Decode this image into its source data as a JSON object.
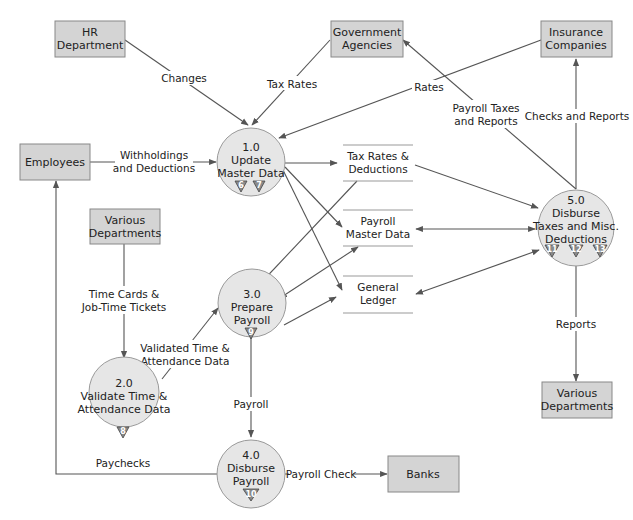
{
  "diagram": {
    "type": "data-flow-diagram",
    "entities": [
      {
        "id": "hr",
        "line1": "HR",
        "line2": "Department"
      },
      {
        "id": "gov",
        "line1": "Government",
        "line2": "Agencies"
      },
      {
        "id": "ins",
        "line1": "Insurance",
        "line2": "Companies"
      },
      {
        "id": "emp",
        "line1": "Employees",
        "line2": ""
      },
      {
        "id": "vd1",
        "line1": "Various",
        "line2": "Departments"
      },
      {
        "id": "vd2",
        "line1": "Various",
        "line2": "Departments"
      },
      {
        "id": "banks",
        "line1": "Banks",
        "line2": ""
      }
    ],
    "processes": [
      {
        "id": "p1",
        "number": "1.0",
        "line1": "Update",
        "line2": "Master Data",
        "line3": "",
        "markers": [
          "6",
          "7"
        ]
      },
      {
        "id": "p2",
        "number": "2.0",
        "line1": "Validate Time &",
        "line2": "Attendance Data",
        "line3": "",
        "markers": [
          "8"
        ]
      },
      {
        "id": "p3",
        "number": "3.0",
        "line1": "Prepare",
        "line2": "Payroll",
        "line3": "",
        "markers": [
          "9"
        ]
      },
      {
        "id": "p4",
        "number": "4.0",
        "line1": "Disburse",
        "line2": "Payroll",
        "line3": "",
        "markers": [
          "10"
        ]
      },
      {
        "id": "p5",
        "number": "5.0",
        "line1": "Disburse",
        "line2": "Taxes and Misc.",
        "line3": "Deductions",
        "markers": [
          "11",
          "12",
          "13"
        ]
      }
    ],
    "data_stores": [
      {
        "id": "ds1",
        "line1": "Tax Rates &",
        "line2": "Deductions"
      },
      {
        "id": "ds2",
        "line1": "Payroll",
        "line2": "Master Data"
      },
      {
        "id": "ds3",
        "line1": "General",
        "line2": "Ledger"
      }
    ],
    "flows": [
      {
        "id": "f-changes",
        "line1": "Changes",
        "line2": ""
      },
      {
        "id": "f-taxrates",
        "line1": "Tax Rates",
        "line2": ""
      },
      {
        "id": "f-rates",
        "line1": "Rates",
        "line2": ""
      },
      {
        "id": "f-withholdings",
        "line1": "Withholdings",
        "line2": "and Deductions"
      },
      {
        "id": "f-payrolltaxes",
        "line1": "Payroll Taxes",
        "line2": "and Reports"
      },
      {
        "id": "f-checks",
        "line1": "Checks and Reports",
        "line2": ""
      },
      {
        "id": "f-timecards",
        "line1": "Time Cards &",
        "line2": "Job-Time Tickets"
      },
      {
        "id": "f-validated",
        "line1": "Validated Time &",
        "line2": "Attendance Data"
      },
      {
        "id": "f-payroll",
        "line1": "Payroll",
        "line2": ""
      },
      {
        "id": "f-paychecks",
        "line1": "Paychecks",
        "line2": ""
      },
      {
        "id": "f-payrollcheck",
        "line1": "Payroll Check",
        "line2": ""
      },
      {
        "id": "f-reports",
        "line1": "Reports",
        "line2": ""
      }
    ]
  },
  "colors": {
    "entity_fill": "#d4d4d4",
    "process_fill": "#e6e6e6",
    "marker_fill": "#8a8a8a",
    "line": "#555555"
  }
}
